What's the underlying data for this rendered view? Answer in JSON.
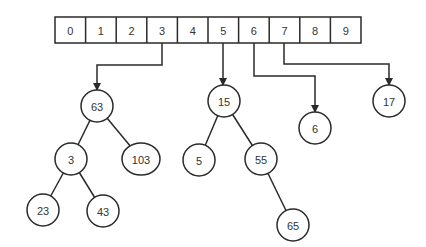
{
  "diagram": {
    "stroke_color": "#2a2a2a",
    "text_color": "#333333",
    "array": {
      "x": 55,
      "y": 17,
      "cell_width": 30.6,
      "height": 26,
      "cells": [
        "0",
        "1",
        "2",
        "3",
        "4",
        "5",
        "6",
        "7",
        "8",
        "9"
      ]
    },
    "nodes": [
      {
        "id": "n63",
        "label": "63",
        "cx": 97,
        "cy": 106,
        "rx": 16,
        "ry": 16
      },
      {
        "id": "n3",
        "label": "3",
        "cx": 71,
        "cy": 159,
        "rx": 16,
        "ry": 16
      },
      {
        "id": "n103",
        "label": "103",
        "cx": 141,
        "cy": 159,
        "rx": 19,
        "ry": 16
      },
      {
        "id": "n23",
        "label": "23",
        "cx": 43,
        "cy": 210,
        "rx": 16,
        "ry": 16
      },
      {
        "id": "n43",
        "label": "43",
        "cx": 103,
        "cy": 211,
        "rx": 16,
        "ry": 16
      },
      {
        "id": "n15",
        "label": "15",
        "cx": 224,
        "cy": 101,
        "rx": 16,
        "ry": 16
      },
      {
        "id": "n5",
        "label": "5",
        "cx": 199,
        "cy": 160,
        "rx": 16,
        "ry": 16
      },
      {
        "id": "n55",
        "label": "55",
        "cx": 261,
        "cy": 159,
        "rx": 16,
        "ry": 16
      },
      {
        "id": "n65",
        "label": "65",
        "cx": 293,
        "cy": 225,
        "rx": 16,
        "ry": 16
      },
      {
        "id": "n6",
        "label": "6",
        "cx": 315,
        "cy": 128,
        "rx": 16,
        "ry": 16
      },
      {
        "id": "n17",
        "label": "17",
        "cx": 389,
        "cy": 101,
        "rx": 16,
        "ry": 16
      }
    ],
    "tree_edges": [
      [
        "n63",
        "n3"
      ],
      [
        "n63",
        "n103"
      ],
      [
        "n3",
        "n23"
      ],
      [
        "n3",
        "n43"
      ],
      [
        "n15",
        "n5"
      ],
      [
        "n15",
        "n55"
      ],
      [
        "n55",
        "n65"
      ]
    ],
    "pointers": [
      {
        "from_cell": "3",
        "to": "n63",
        "points": [
          [
            162,
            43
          ],
          [
            162,
            65
          ],
          [
            97,
            65
          ],
          [
            97,
            90
          ]
        ]
      },
      {
        "from_cell": "5",
        "to": "n15",
        "points": [
          [
            223,
            43
          ],
          [
            223,
            85
          ]
        ]
      },
      {
        "from_cell": "6",
        "to": "n6",
        "points": [
          [
            254,
            43
          ],
          [
            254,
            76
          ],
          [
            315,
            76
          ],
          [
            315,
            112
          ]
        ]
      },
      {
        "from_cell": "7",
        "to": "n17",
        "points": [
          [
            284,
            43
          ],
          [
            284,
            64
          ],
          [
            389,
            64
          ],
          [
            389,
            85
          ]
        ]
      }
    ]
  }
}
